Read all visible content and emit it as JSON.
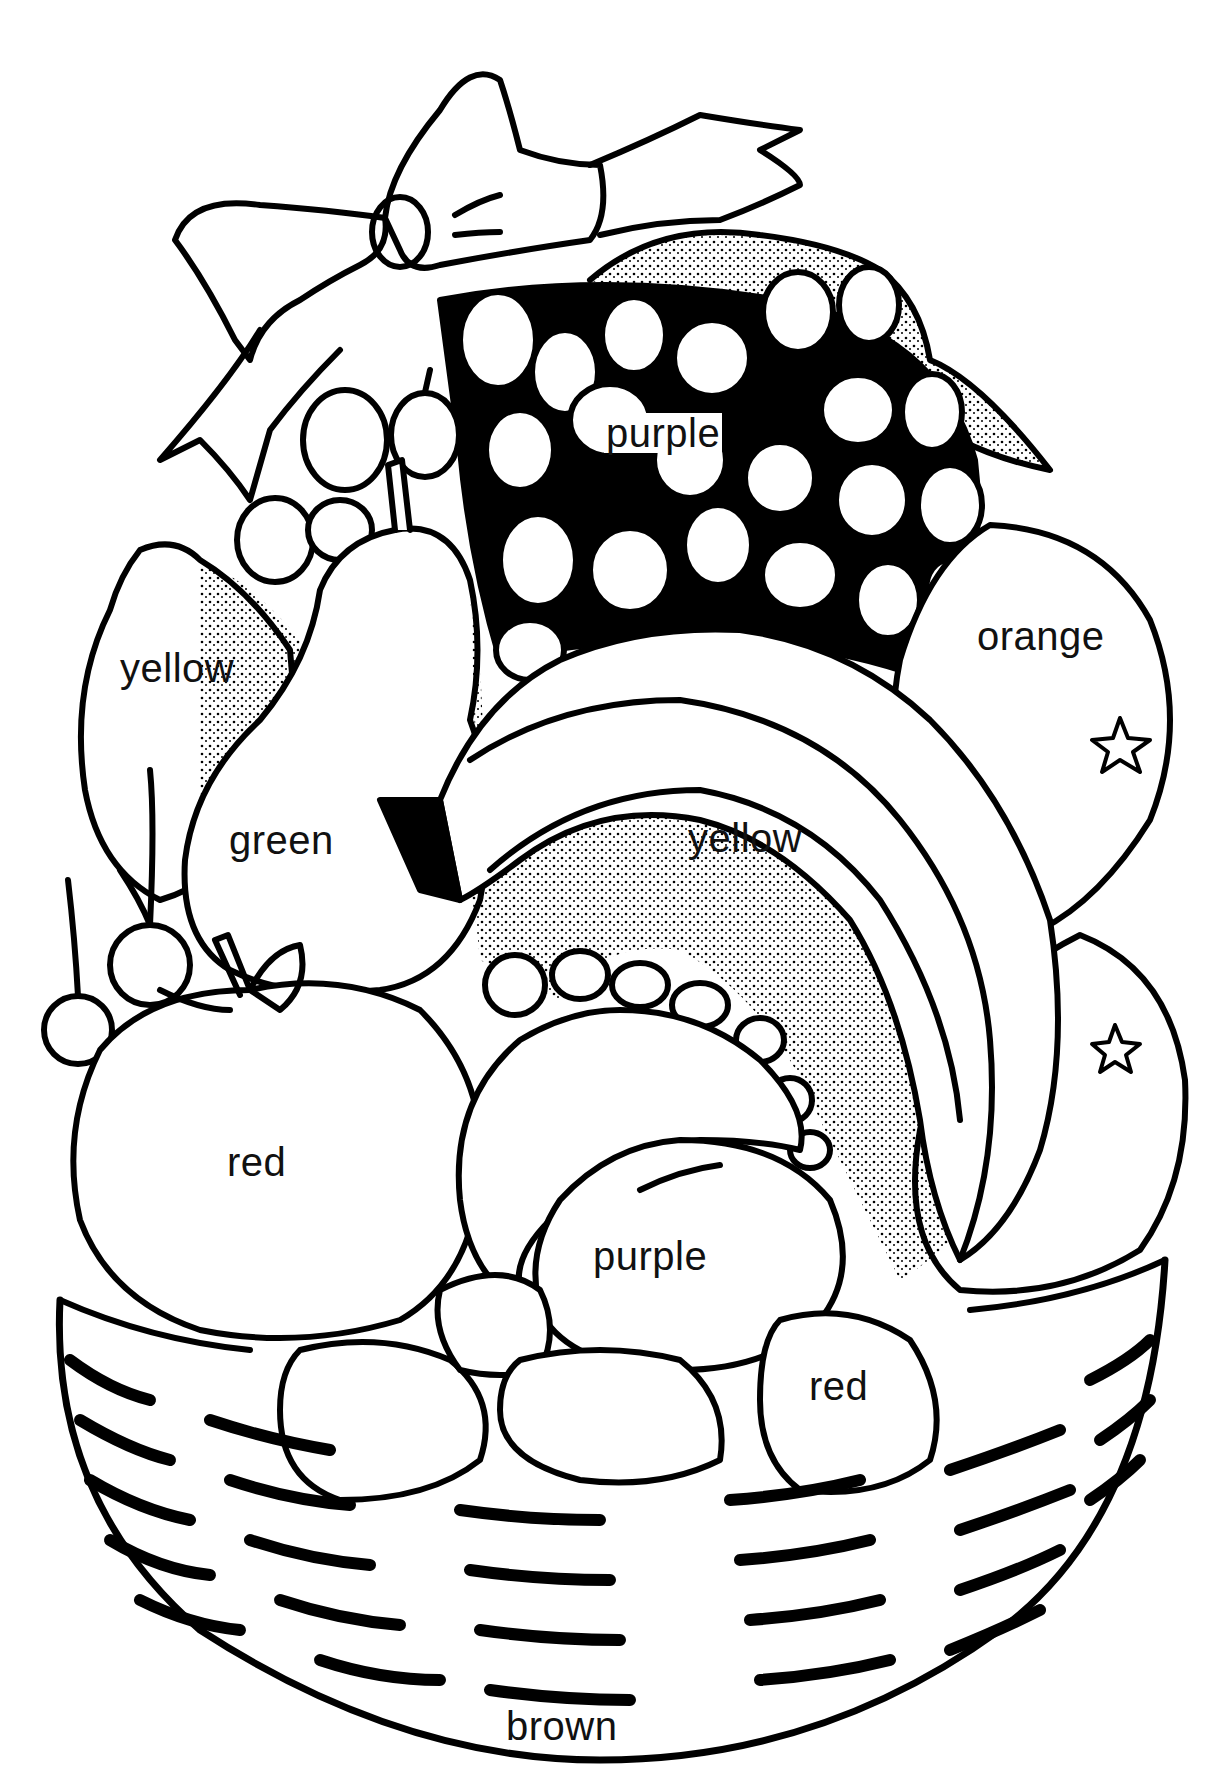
{
  "page": {
    "type": "coloring-page",
    "background": "#ffffff",
    "ink": "#000000"
  },
  "labels": {
    "grapes": {
      "text": "purple",
      "x": 604,
      "y": 413
    },
    "lemon": {
      "text": "yellow",
      "x": 120,
      "y": 648
    },
    "orange_top": {
      "text": "orange",
      "x": 977,
      "y": 616
    },
    "pear": {
      "text": "green",
      "x": 229,
      "y": 820
    },
    "banana": {
      "text": "yellow",
      "x": 688,
      "y": 818
    },
    "apple": {
      "text": "red",
      "x": 227,
      "y": 1142
    },
    "plum": {
      "text": "purple",
      "x": 593,
      "y": 1236
    },
    "strawberry": {
      "text": "red",
      "x": 809,
      "y": 1366
    },
    "basket": {
      "text": "brown",
      "x": 504,
      "y": 1716
    }
  }
}
